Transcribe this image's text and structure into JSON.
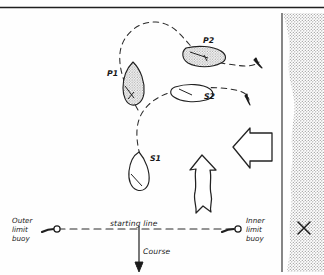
{
  "figure": {
    "ink_color": "#222222",
    "shore_fill": "#b9b9b9",
    "hull_shade": "#cfcfcf",
    "background": "#fefefe"
  },
  "top_rule": {
    "name": "top-divider"
  },
  "boats": [
    {
      "id": "P1",
      "label": "P1",
      "shaded": true,
      "kind": "port-tack-boat"
    },
    {
      "id": "P2",
      "label": "P2",
      "shaded": true,
      "kind": "port-tack-boat"
    },
    {
      "id": "S1",
      "label": "S1",
      "shaded": false,
      "kind": "starboard-tack-boat"
    },
    {
      "id": "S2",
      "label": "S2",
      "shaded": false,
      "kind": "starboard-tack-boat"
    }
  ],
  "tracks": [
    {
      "name": "port-boat-track",
      "style": "dashed",
      "arrowhead": true
    },
    {
      "name": "starboard-boat-track",
      "style": "dashed",
      "arrowhead": true
    }
  ],
  "arrows": {
    "wind": {
      "label": "",
      "name": "wind-direction-arrow",
      "direction": "left",
      "style": "hollow-block"
    },
    "tide": {
      "label": "",
      "name": "tide-current-arrow",
      "direction": "up",
      "style": "hollow-wavy"
    },
    "course": {
      "label": "Course",
      "name": "course-arrow",
      "direction": "down",
      "style": "solid-line"
    }
  },
  "starting_line": {
    "label": "starting line",
    "style": "dashed"
  },
  "buoys": [
    {
      "name": "outer-limit-buoy",
      "label_lines": [
        "Outer",
        "limit",
        "buoy"
      ],
      "side": "left"
    },
    {
      "name": "inner-limit-buoy",
      "label_lines": [
        "Inner",
        "limit",
        "buoy"
      ],
      "side": "right"
    }
  ],
  "shore": {
    "name": "shore-land",
    "mark": "X",
    "mark_name": "shore-cross-mark"
  },
  "labels": {
    "outer_1": "Outer",
    "outer_2": "limit",
    "outer_3": "buoy",
    "inner_1": "Inner",
    "inner_2": "limit",
    "inner_3": "buoy",
    "starting_line": "starting line",
    "course": "Course",
    "p1": "P1",
    "p2": "P2",
    "s1": "S1",
    "s2": "S2",
    "shore_mark": "X"
  }
}
